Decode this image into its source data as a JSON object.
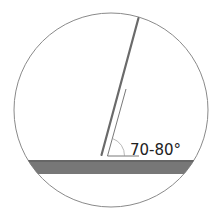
{
  "diagram": {
    "angle_label": "70-80°",
    "colors": {
      "circle_stroke": "#888888",
      "surface_fill": "#777777",
      "needle": "#666666",
      "guide": "#555555"
    }
  }
}
